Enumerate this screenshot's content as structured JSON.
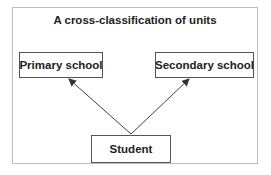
{
  "diagram": {
    "title": "A cross-classification of units",
    "nodes": [
      {
        "id": "primary",
        "label": "Primary school"
      },
      {
        "id": "secondary",
        "label": "Secondary school"
      },
      {
        "id": "student",
        "label": "Student"
      }
    ],
    "edges": [
      {
        "from": "student",
        "to": "primary"
      },
      {
        "from": "student",
        "to": "secondary"
      }
    ]
  }
}
